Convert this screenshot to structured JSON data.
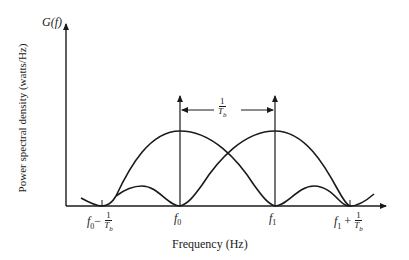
{
  "diagram": {
    "y_axis_symbol": "G(f)",
    "y_axis_label": "Power spectral density (watts/Hz)",
    "x_axis_label": "Frequency (Hz)",
    "spacing_label": {
      "numerator": "1",
      "denominator": "T",
      "denominator_sub": "b"
    },
    "ticks": [
      {
        "id": "f0_minus",
        "base": "f",
        "sub": "0",
        "op": "−",
        "frac_num": "1",
        "frac_den": "T",
        "frac_den_sub": "b"
      },
      {
        "id": "f0",
        "base": "f",
        "sub": "0"
      },
      {
        "id": "f1",
        "base": "f",
        "sub": "1"
      },
      {
        "id": "f1_plus",
        "base": "f",
        "sub": "1",
        "op": "+",
        "frac_num": "1",
        "frac_den": "T",
        "frac_den_sub": "b"
      }
    ],
    "colors": {
      "line": "#1a1a1a",
      "background": "#ffffff"
    }
  }
}
